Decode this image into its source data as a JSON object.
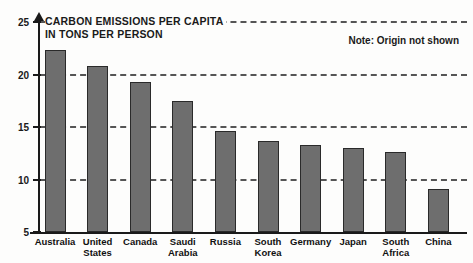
{
  "chart_data": {
    "type": "bar",
    "title": "CARBON EMISSIONS PER CAPITA\nIN TONS PER PERSON",
    "title_line1": "CARBON EMISSIONS PER CAPITA",
    "title_line2": "IN TONS PER PERSON",
    "note": "Note: Origin not shown",
    "xlabel": "",
    "ylabel": "",
    "ylim": [
      5,
      25
    ],
    "yticks": [
      5,
      10,
      15,
      20,
      25
    ],
    "ytick_labels": [
      "5",
      "10",
      "15",
      "20",
      "25"
    ],
    "gridlines": [
      10,
      15,
      20,
      25
    ],
    "grid": true,
    "legend": "none",
    "categories": [
      "Australia",
      "United\nStates",
      "Canada",
      "Saudi\nArabia",
      "Russia",
      "South\nKorea",
      "Germany",
      "Japan",
      "South\nAfrica",
      "China"
    ],
    "values": [
      22.3,
      20.8,
      19.3,
      17.5,
      14.6,
      13.7,
      13.3,
      13.0,
      12.6,
      9.1
    ],
    "bar_color": "#6e6e6e",
    "bar_border_color": "#2a2a2a",
    "axis_color": "#1a1a1a",
    "gridline_color": "#555555",
    "background_color": "#fdfdfc"
  }
}
